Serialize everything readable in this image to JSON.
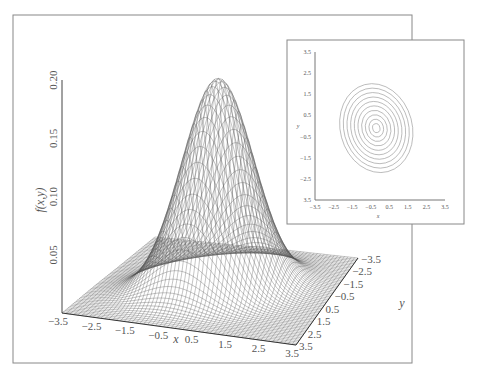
{
  "chart_data": [
    {
      "id": "surface",
      "type": "surface3d",
      "title": "",
      "function": "bivariate normal density f(x,y)",
      "zlabel": "f(x,y)",
      "xlabel": "x",
      "ylabel": "y",
      "xlim": [
        -3.5,
        3.5
      ],
      "ylim": [
        -3.5,
        3.5
      ],
      "zlim": [
        0,
        0.2
      ],
      "peak_value": 0.18,
      "x_ticks": [
        "−3.5",
        "−2.5",
        "−1.5",
        "−0.5",
        "0.5",
        "1.5",
        "2.5",
        "3.5"
      ],
      "y_ticks": [
        "−3.5",
        "−2.5",
        "−1.5",
        "−0.5",
        "0.5",
        "1.5",
        "2.5",
        "3.5"
      ],
      "z_ticks": [
        "0.05",
        "0.10",
        "0.15",
        "0.20"
      ],
      "z_tick_values": [
        0.05,
        0.1,
        0.15,
        0.2
      ],
      "params": {
        "mu_x": 0,
        "mu_y": 0,
        "sigma_x": 1.0,
        "sigma_y": 1.0,
        "rho": 0.3
      }
    },
    {
      "id": "contour",
      "type": "contour",
      "title": "",
      "xlabel": "x",
      "ylabel": "y",
      "xlim": [
        -3.5,
        3.5
      ],
      "ylim": [
        -3.5,
        3.5
      ],
      "x_ticks": [
        "−3.5",
        "−2.5",
        "−1.5",
        "−0.5",
        "0.5",
        "1.5",
        "2.5",
        "3.5"
      ],
      "y_ticks": [
        "3.5",
        "2.5",
        "1.5",
        "0.5",
        "−0.5",
        "−1.5",
        "−2.5",
        "3.5"
      ],
      "levels": 10,
      "center": [
        -0.2,
        -0.1
      ]
    }
  ]
}
